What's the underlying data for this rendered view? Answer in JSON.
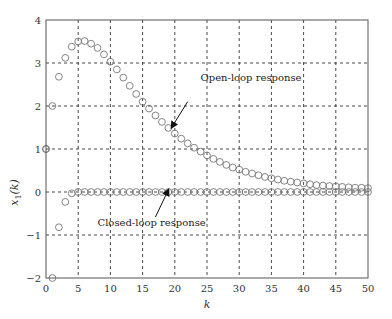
{
  "chart_data": {
    "type": "scatter",
    "title": "",
    "xlabel": "k",
    "ylabel": "x1(k)",
    "ylabel_main": "x",
    "ylabel_sub": "1",
    "ylabel_tail": "(k)",
    "xlim": [
      0,
      50
    ],
    "ylim": [
      -2,
      4
    ],
    "x_ticks": [
      0,
      5,
      10,
      15,
      20,
      25,
      30,
      35,
      40,
      45,
      50
    ],
    "y_ticks": [
      -2,
      -1,
      0,
      1,
      2,
      3,
      4
    ],
    "grid": true,
    "grid_style": "dashed",
    "legend": "none",
    "marker": "open-circle",
    "series": [
      {
        "name": "Open-loop response",
        "x": [
          0,
          1,
          2,
          3,
          4,
          5,
          6,
          7,
          8,
          9,
          10,
          11,
          12,
          13,
          14,
          15,
          16,
          17,
          18,
          19,
          20,
          21,
          22,
          23,
          24,
          25,
          26,
          27,
          28,
          29,
          30,
          31,
          32,
          33,
          34,
          35,
          36,
          37,
          38,
          39,
          40,
          41,
          42,
          43,
          44,
          45,
          46,
          47,
          48,
          49,
          50
        ],
        "values": [
          1.0,
          2.0,
          2.68,
          3.12,
          3.38,
          3.5,
          3.51,
          3.45,
          3.35,
          3.2,
          3.03,
          2.85,
          2.66,
          2.47,
          2.28,
          2.1,
          1.94,
          1.78,
          1.63,
          1.49,
          1.36,
          1.24,
          1.13,
          1.03,
          0.94,
          0.85,
          0.77,
          0.7,
          0.63,
          0.57,
          0.52,
          0.47,
          0.43,
          0.39,
          0.35,
          0.32,
          0.29,
          0.26,
          0.24,
          0.22,
          0.2,
          0.18,
          0.16,
          0.15,
          0.14,
          0.13,
          0.12,
          0.11,
          0.1,
          0.1,
          0.09
        ]
      },
      {
        "name": "Closed-loop response",
        "x": [
          0,
          1,
          2,
          3,
          4,
          5,
          6,
          7,
          8,
          9,
          10,
          11,
          12,
          13,
          14,
          15,
          16,
          17,
          18,
          19,
          20,
          21,
          22,
          23,
          24,
          25,
          26,
          27,
          28,
          29,
          30,
          31,
          32,
          33,
          34,
          35,
          36,
          37,
          38,
          39,
          40,
          41,
          42,
          43,
          44,
          45,
          46,
          47,
          48,
          49,
          50
        ],
        "values": [
          1.0,
          -2.0,
          -0.82,
          -0.23,
          -0.03,
          0.0,
          0.0,
          0.0,
          0.0,
          0.0,
          0.0,
          0.0,
          0.0,
          0.0,
          0.0,
          0.0,
          0.0,
          0.0,
          0.0,
          0.0,
          0.0,
          0.0,
          0.0,
          0.0,
          0.0,
          0.0,
          0.0,
          0.0,
          0.0,
          0.0,
          0.0,
          0.0,
          0.0,
          0.0,
          0.0,
          0.0,
          0.0,
          0.0,
          0.0,
          0.0,
          0.0,
          0.0,
          0.0,
          0.0,
          0.0,
          0.0,
          0.0,
          0.0,
          0.0,
          0.0,
          0.0
        ]
      }
    ],
    "annotations": [
      {
        "text": "Open-loop response",
        "text_at": [
          24,
          2.58
        ],
        "arrow_from": [
          22,
          2.1
        ],
        "arrow_to": [
          19.5,
          1.5
        ]
      },
      {
        "text": "Closed-loop response",
        "text_at": [
          8,
          -0.8
        ],
        "arrow_from": [
          17,
          -0.58
        ],
        "arrow_to": [
          19,
          0.05
        ]
      }
    ]
  },
  "colors": {
    "axes": "#555555",
    "grid": "#333333",
    "marker": "#777777",
    "text": "#333333"
  }
}
